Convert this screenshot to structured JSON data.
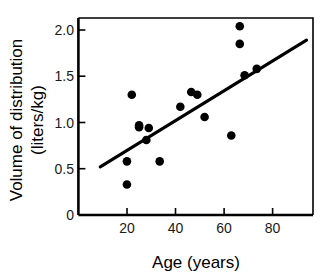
{
  "figure": {
    "background_color": "#ffffff",
    "ink_color": "#000000",
    "marker_color": "#000000",
    "line_color": "#000000"
  },
  "axes": {
    "x_label": "Age (years)",
    "y_label_line1": "Volume of distribution",
    "y_label_line2": "(liters/kg)",
    "x_ticks": [
      "20",
      "40",
      "60",
      "80"
    ],
    "y_ticks": [
      "0",
      "0.5",
      "1.0",
      "1.5",
      "2.0"
    ]
  },
  "chart_data": {
    "type": "scatter",
    "title": "",
    "xlabel": "Age (years)",
    "ylabel": "Volume of distribution (liters/kg)",
    "xlim": [
      0,
      96
    ],
    "ylim": [
      0,
      2.13
    ],
    "xticks": [
      20,
      40,
      60,
      80
    ],
    "yticks": [
      0,
      0.5,
      1.0,
      1.5,
      2.0
    ],
    "grid": false,
    "legend": false,
    "series": [
      {
        "name": "Subjects",
        "type": "scatter",
        "marker": "filled-circle",
        "color": "#000000",
        "points": [
          {
            "x": 20,
            "y": 0.33
          },
          {
            "x": 20,
            "y": 0.58
          },
          {
            "x": 22,
            "y": 1.3
          },
          {
            "x": 25,
            "y": 0.97
          },
          {
            "x": 25,
            "y": 0.95
          },
          {
            "x": 28,
            "y": 0.81
          },
          {
            "x": 29,
            "y": 0.94
          },
          {
            "x": 33.5,
            "y": 0.58
          },
          {
            "x": 42,
            "y": 1.17
          },
          {
            "x": 46.5,
            "y": 1.33
          },
          {
            "x": 49,
            "y": 1.3
          },
          {
            "x": 52,
            "y": 1.06
          },
          {
            "x": 63,
            "y": 0.86
          },
          {
            "x": 66.5,
            "y": 2.04
          },
          {
            "x": 66.5,
            "y": 1.85
          },
          {
            "x": 68.5,
            "y": 1.51
          },
          {
            "x": 73.5,
            "y": 1.58
          }
        ]
      },
      {
        "name": "Regression line",
        "type": "line",
        "color": "#000000",
        "x_start": 9,
        "y_start": 0.52,
        "x_end": 94,
        "y_end": 1.89
      }
    ]
  }
}
